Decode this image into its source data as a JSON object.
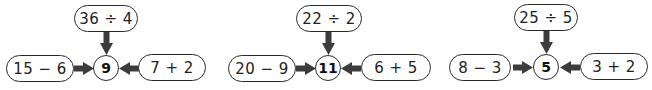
{
  "colors": {
    "stroke": "#2a2a2a",
    "arrow": "#3c3c3c",
    "background": "#ffffff"
  },
  "units": [
    {
      "center": "9",
      "top": "36 ÷ 4",
      "left": "15 − 6",
      "right": "7 + 2"
    },
    {
      "center": "11",
      "top": "22 ÷ 2",
      "left": "20 − 9",
      "right": "6 + 5"
    },
    {
      "center": "5",
      "top": "25 ÷ 5",
      "left": "8 − 3",
      "right": "3 + 2"
    }
  ]
}
